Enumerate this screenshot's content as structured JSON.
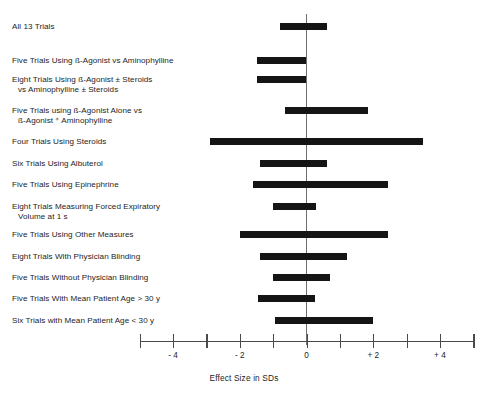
{
  "figure": {
    "name": "forest-plot-effect-size",
    "background": "#ffffff",
    "bar_color": "#151515",
    "axis_color": "#4a4a4a",
    "zero_line_color": "#6f6f6f"
  },
  "axis": {
    "title": "Effect Size in SDs",
    "ticks": [
      {
        "value": -5,
        "label": ""
      },
      {
        "value": -4,
        "label": "- 4"
      },
      {
        "value": -3,
        "label": ""
      },
      {
        "value": -2,
        "label": "- 2"
      },
      {
        "value": -1,
        "label": ""
      },
      {
        "value": 0,
        "label": "0"
      },
      {
        "value": 1,
        "label": ""
      },
      {
        "value": 2,
        "label": "+ 2"
      },
      {
        "value": 3,
        "label": ""
      },
      {
        "value": 4,
        "label": "+ 4"
      },
      {
        "value": 5,
        "label": ""
      }
    ]
  },
  "rows": [
    {
      "label_line1": "All 13 Trials",
      "label_line2": "",
      "low": -0.78,
      "high": 0.6
    },
    {
      "label_line1": "Five Trials Using ß-Agonist vs Aminophylline",
      "label_line2": "",
      "low": -1.47,
      "high": 0.0
    },
    {
      "label_line1": "Eight Trials Using ß-Agonist ± Steroids",
      "label_line2": "vs Aminophylline ± Steroids",
      "low": -1.47,
      "high": 0.0
    },
    {
      "label_line1": "Five Trials using ß-Agonist Alone vs",
      "label_line2": "ß-Agonist ⁺ Aminophylline",
      "low": -0.63,
      "high": 1.83
    },
    {
      "label_line1": "Four Trials Using Steroids",
      "label_line2": "",
      "low": -2.9,
      "high": 3.5
    },
    {
      "label_line1": "Six Trials Using Albuterol",
      "label_line2": "",
      "low": -1.4,
      "high": 0.63
    },
    {
      "label_line1": "Five Trials Using Epinephrine",
      "label_line2": "",
      "low": -1.6,
      "high": 2.43
    },
    {
      "label_line1": "Eight Trials Measuring Forced Expiratory",
      "label_line2": "Volume at 1 s",
      "low": -1.0,
      "high": 0.3
    },
    {
      "label_line1": "Five Trials Using Other Measures",
      "label_line2": "",
      "low": -2.0,
      "high": 2.43
    },
    {
      "label_line1": "Eight Trials With Physician Blinding",
      "label_line2": "",
      "low": -1.4,
      "high": 1.2
    },
    {
      "label_line1": "Five Trials Without Physician Blinding",
      "label_line2": "",
      "low": -1.0,
      "high": 0.7
    },
    {
      "label_line1": "Five Trials With Mean Patient Age > 30 y",
      "label_line2": "",
      "low": -1.45,
      "high": 0.25
    },
    {
      "label_line1": "Six Trials with Mean Patient Age < 30 y",
      "label_line2": "",
      "low": -0.95,
      "high": 2.0
    }
  ],
  "chart_data": {
    "type": "bar",
    "title": "",
    "subtitle": "",
    "xlabel": "Effect Size in SDs",
    "ylabel": "",
    "xlim": [
      -5,
      5
    ],
    "grid": false,
    "legend": "none",
    "orientation": "horizontal",
    "reference_line": 0,
    "xticks": [
      -5,
      -4,
      -3,
      -2,
      -1,
      0,
      1,
      2,
      3,
      4,
      5
    ],
    "xticklabels": [
      "",
      "- 4",
      "",
      "- 2",
      "",
      "0",
      "",
      "+ 2",
      "",
      "+ 4",
      ""
    ],
    "categories": [
      "All 13 Trials",
      "Five Trials Using ß-Agonist vs Aminophylline",
      "Eight Trials Using ß-Agonist ± Steroids vs Aminophylline ± Steroids",
      "Five Trials using ß-Agonist Alone vs ß-Agonist ⁺ Aminophylline",
      "Four Trials Using Steroids",
      "Six Trials Using Albuterol",
      "Five Trials Using Epinephrine",
      "Eight Trials Measuring Forced Expiratory Volume at 1 s",
      "Five Trials Using Other Measures",
      "Eight Trials With Physician Blinding",
      "Five Trials Without Physician Blinding",
      "Five Trials With Mean Patient Age > 30 y",
      "Six Trials with Mean Patient Age < 30 y"
    ],
    "intervals": [
      {
        "low": -0.78,
        "high": 0.6
      },
      {
        "low": -1.47,
        "high": 0.0
      },
      {
        "low": -1.47,
        "high": 0.0
      },
      {
        "low": -0.63,
        "high": 1.83
      },
      {
        "low": -2.9,
        "high": 3.5
      },
      {
        "low": -1.4,
        "high": 0.63
      },
      {
        "low": -1.6,
        "high": 2.43
      },
      {
        "low": -1.0,
        "high": 0.3
      },
      {
        "low": -2.0,
        "high": 2.43
      },
      {
        "low": -1.4,
        "high": 1.2
      },
      {
        "low": -1.0,
        "high": 0.7
      },
      {
        "low": -1.45,
        "high": 0.25
      },
      {
        "low": -0.95,
        "high": 2.0
      }
    ]
  }
}
